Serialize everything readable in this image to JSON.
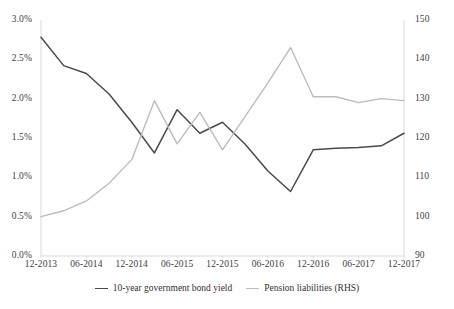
{
  "chart_data": {
    "type": "line",
    "title": "",
    "subtitle": "",
    "xlabel": "",
    "ylabel": "",
    "grid": false,
    "legend_position": "bottom",
    "x": [
      "12-2013",
      "03-2014",
      "06-2014",
      "09-2014",
      "12-2014",
      "03-2015",
      "06-2015",
      "09-2015",
      "12-2015",
      "03-2016",
      "06-2016",
      "09-2016",
      "12-2016",
      "03-2017",
      "06-2017",
      "09-2017",
      "12-2017"
    ],
    "xtick_labels": [
      "12-2013",
      "06-2014",
      "12-2014",
      "06-2015",
      "12-2015",
      "06-2016",
      "12-2016",
      "06-2017",
      "12-2017"
    ],
    "axes": {
      "left": {
        "label": "",
        "ylim": [
          0.0,
          3.0
        ],
        "ticks": [
          0.0,
          0.5,
          1.0,
          1.5,
          2.0,
          2.5,
          3.0
        ],
        "tick_labels": [
          "0.0%",
          "0.5%",
          "1.0%",
          "1.5%",
          "2.0%",
          "2.5%",
          "3.0%"
        ],
        "unit": "%"
      },
      "right": {
        "label": "RHS",
        "ylim": [
          90,
          150
        ],
        "ticks": [
          90,
          100,
          110,
          120,
          130,
          140,
          150
        ],
        "tick_labels": [
          "90",
          "100",
          "110",
          "120",
          "130",
          "140",
          "150"
        ],
        "unit": ""
      }
    },
    "series": [
      {
        "name": "10-year government bond yield",
        "axis": "left",
        "color": "#4a4a4a",
        "values": [
          2.78,
          2.42,
          2.32,
          2.06,
          1.7,
          1.31,
          1.86,
          1.56,
          1.7,
          1.42,
          1.08,
          0.82,
          1.35,
          1.37,
          1.38,
          1.4,
          1.56
        ]
      },
      {
        "name": "Pension liabilities (RHS)",
        "axis": "right",
        "color": "#bcbcbc",
        "values": [
          100.0,
          101.5,
          104.0,
          108.5,
          114.5,
          129.5,
          118.5,
          126.5,
          117.0,
          125.5,
          134.0,
          143.0,
          130.5,
          130.5,
          129.0,
          130.0,
          129.5
        ]
      }
    ]
  },
  "legend": {
    "entries": [
      {
        "label": "10-year government bond yield",
        "color": "#4a4a4a"
      },
      {
        "label": "Pension liabilities (RHS)",
        "color": "#bcbcbc"
      }
    ]
  }
}
